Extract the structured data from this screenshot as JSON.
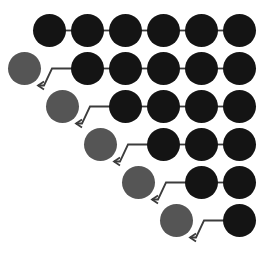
{
  "canvas": {
    "width": 272,
    "height": 261,
    "background": "#ffffff"
  },
  "style": {
    "node_dark_color": "#141414",
    "node_gray_color": "#555555",
    "edge_color": "#3c3c3c",
    "arrow_color": "#3c3c3c",
    "node_radius": 16.5,
    "edge_width": 1.8,
    "arrow_width": 1.8
  },
  "layout": {
    "row_count": 6,
    "column_step_x": 38,
    "row_step_y": 38,
    "first_node_center_x": 49.5,
    "first_row_center_y": 30.5
  },
  "chart_data": {
    "type": "diagram",
    "title": "",
    "rows": [
      {
        "index": 1,
        "center_y": 30.5,
        "start_column": 0,
        "gray_node": null,
        "dark_node_count": 6,
        "dark_node_columns": [
          0,
          1,
          2,
          3,
          4,
          5
        ],
        "straight_edges": 5,
        "zigzag_arrows": 0
      },
      {
        "index": 2,
        "center_y": 68.5,
        "start_column": 0,
        "gray_node": {
          "column": 0,
          "center_x": 24.5
        },
        "dark_node_count": 5,
        "dark_node_columns": [
          1,
          2,
          3,
          4,
          5
        ],
        "straight_edges": 4,
        "zigzag_arrows": 1
      },
      {
        "index": 3,
        "center_y": 106.5,
        "start_column": 1,
        "gray_node": {
          "column": 1,
          "center_x": 62.5
        },
        "dark_node_count": 4,
        "dark_node_columns": [
          2,
          3,
          4,
          5
        ],
        "straight_edges": 3,
        "zigzag_arrows": 1
      },
      {
        "index": 4,
        "center_y": 144.5,
        "start_column": 2,
        "gray_node": {
          "column": 2,
          "center_x": 100.5
        },
        "dark_node_count": 3,
        "dark_node_columns": [
          3,
          4,
          5
        ],
        "straight_edges": 2,
        "zigzag_arrows": 1
      },
      {
        "index": 5,
        "center_y": 182.5,
        "start_column": 3,
        "gray_node": {
          "column": 3,
          "center_x": 138.5
        },
        "dark_node_count": 2,
        "dark_node_columns": [
          4,
          5
        ],
        "straight_edges": 1,
        "zigzag_arrows": 1
      },
      {
        "index": 6,
        "center_y": 220.5,
        "start_column": 4,
        "gray_node": {
          "column": 4,
          "center_x": 176.5
        },
        "dark_node_count": 1,
        "dark_node_columns": [
          5
        ],
        "straight_edges": 0,
        "zigzag_arrows": 1
      }
    ],
    "totals": {
      "dark_nodes": 21,
      "gray_nodes": 5,
      "straight_edges": 15,
      "zigzag_arrows": 5
    }
  }
}
